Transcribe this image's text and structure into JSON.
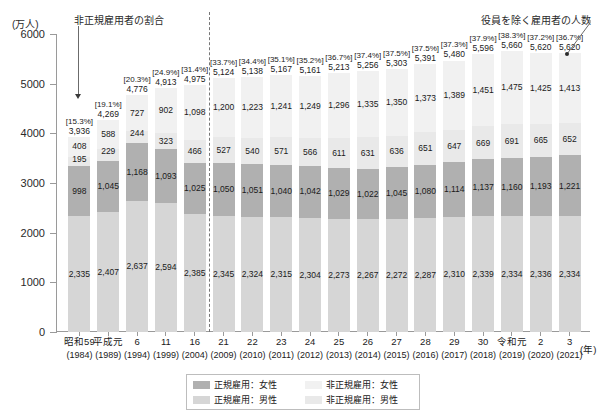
{
  "axis": {
    "unit_label": "(万人)",
    "x_unit_label": "(年)",
    "y_ticks": [
      "6000",
      "5000",
      "4000",
      "3000",
      "2000",
      "1000",
      "0"
    ]
  },
  "annotations": {
    "left_note": "非正規雇用者の割合",
    "right_note": "役員を除く雇用者の人数"
  },
  "legend": {
    "items": [
      {
        "label": "正規雇用：女性",
        "color": "#b0b0b0"
      },
      {
        "label": "非正規雇用：女性",
        "color": "#f1f1f1"
      },
      {
        "label": "正規雇用：男性",
        "color": "#d6d6d6"
      },
      {
        "label": "非正規雇用：男性",
        "color": "#e9e9e9"
      }
    ]
  },
  "chart_data": {
    "type": "bar",
    "title": "",
    "xlabel": "(年)",
    "ylabel": "(万人)",
    "ylim": [
      0,
      6000
    ],
    "grid": false,
    "legend_position": "bottom",
    "categories": [
      "昭和59",
      "平成元",
      "6",
      "11",
      "16",
      "21",
      "22",
      "23",
      "24",
      "25",
      "26",
      "27",
      "28",
      "29",
      "30",
      "令和元",
      "2",
      "3"
    ],
    "years": [
      "(1984)",
      "(1989)",
      "(1994)",
      "(1999)",
      "(2004)",
      "(2009)",
      "(2010)",
      "(2011)",
      "(2012)",
      "(2013)",
      "(2014)",
      "(2015)",
      "(2016)",
      "(2017)",
      "(2018)",
      "(2019)",
      "(2020)",
      "(2021)"
    ],
    "series": [
      {
        "name": "正規雇用：男性",
        "color": "#d6d6d6",
        "values": [
          2335,
          2407,
          2637,
          2594,
          2385,
          2345,
          2324,
          2315,
          2304,
          2273,
          2267,
          2272,
          2287,
          2310,
          2339,
          2334,
          2336,
          2334
        ]
      },
      {
        "name": "正規雇用：女性",
        "color": "#b0b0b0",
        "values": [
          998,
          1045,
          1168,
          1093,
          1025,
          1050,
          1051,
          1040,
          1042,
          1029,
          1022,
          1045,
          1080,
          1114,
          1137,
          1160,
          1193,
          1221
        ]
      },
      {
        "name": "非正規雇用：男性",
        "color": "#e9e9e9",
        "values": [
          195,
          229,
          244,
          323,
          466,
          527,
          540,
          571,
          566,
          611,
          631,
          636,
          651,
          647,
          669,
          691,
          665,
          652
        ]
      },
      {
        "name": "非正規雇用：女性",
        "color": "#f1f1f1",
        "values": [
          408,
          588,
          727,
          902,
          1098,
          1200,
          1223,
          1241,
          1249,
          1296,
          1335,
          1350,
          1373,
          1389,
          1451,
          1475,
          1425,
          1413
        ]
      }
    ],
    "totals": [
      3936,
      4269,
      4776,
      4913,
      4975,
      5124,
      5138,
      5167,
      5161,
      5213,
      5256,
      5303,
      5391,
      5480,
      5596,
      5660,
      5620,
      5620
    ],
    "nonregular_share": [
      "[15.3%]",
      "[19.1%]",
      "[20.3%]",
      "[24.9%]",
      "[31.4%]",
      "[33.7%]",
      "[34.4%]",
      "[35.1%]",
      "[35.2%]",
      "[36.7%]",
      "[37.4%]",
      "[37.5%]",
      "[37.5%]",
      "[37.3%]",
      "[37.9%]",
      "[38.3%]",
      "[37.2%]",
      "[36.7%]"
    ],
    "totals_formatted": [
      "3,936",
      "4,269",
      "4,776",
      "4,913",
      "4,975",
      "5,124",
      "5,138",
      "5,167",
      "5,161",
      "5,213",
      "5,256",
      "5,303",
      "5,391",
      "5,480",
      "5,596",
      "5,660",
      "5,620",
      "5,620"
    ]
  }
}
